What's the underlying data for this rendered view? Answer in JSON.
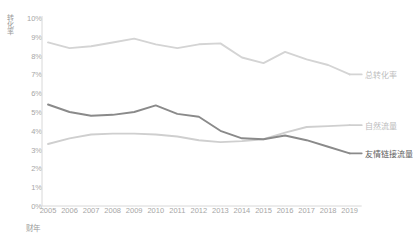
{
  "chart_data": {
    "type": "line",
    "title": "",
    "xlabel": "财年",
    "ylabel": "转化率",
    "x": [
      2005,
      2006,
      2007,
      2008,
      2009,
      2010,
      2011,
      2012,
      2013,
      2014,
      2015,
      2016,
      2017,
      2018,
      2019
    ],
    "categories": [
      "2005",
      "2006",
      "2007",
      "2008",
      "2009",
      "2010",
      "2011",
      "2012",
      "2013",
      "2014",
      "2015",
      "2016",
      "2017",
      "2018",
      "2019"
    ],
    "ylim": [
      0,
      10
    ],
    "yticks": [
      "0%",
      "1%",
      "2%",
      "3%",
      "4%",
      "5%",
      "6%",
      "7%",
      "8%",
      "9%",
      "10%"
    ],
    "ytick_values": [
      0,
      1,
      2,
      3,
      4,
      5,
      6,
      7,
      8,
      9,
      10
    ],
    "grid": false,
    "legend": "right-inline",
    "series": [
      {
        "name": "总转化率",
        "color": "#d4d4d4",
        "label_color": "#bdbdbd",
        "values": [
          8.7,
          8.4,
          8.5,
          8.7,
          8.9,
          8.6,
          8.4,
          8.6,
          8.65,
          7.9,
          7.6,
          8.2,
          7.8,
          7.5,
          7.0
        ]
      },
      {
        "name": "自然流量",
        "color": "#cfcfcf",
        "label_color": "#bdbdbd",
        "values": [
          3.3,
          3.6,
          3.8,
          3.85,
          3.85,
          3.8,
          3.7,
          3.5,
          3.4,
          3.45,
          3.55,
          3.9,
          4.2,
          4.25,
          4.3
        ]
      },
      {
        "name": "友情链接流量",
        "color": "#8a8a8a",
        "label_color": "#5e5e5e",
        "values": [
          5.4,
          5.0,
          4.8,
          4.85,
          5.0,
          5.35,
          4.9,
          4.75,
          4.0,
          3.6,
          3.55,
          3.75,
          3.5,
          3.15,
          2.8
        ]
      }
    ]
  }
}
